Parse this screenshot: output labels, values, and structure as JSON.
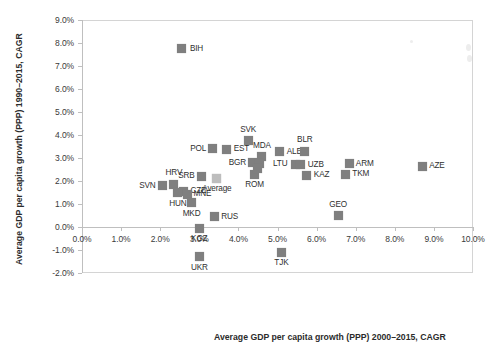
{
  "chart_data": {
    "type": "scatter",
    "title": "",
    "xlabel": "Average GDP per capita growth (PPP) 2000–2015, CAGR",
    "ylabel": "Average GDP per capita growth (PPP) 1990–2015, CAGR",
    "xlim": [
      0.0,
      10.0
    ],
    "ylim": [
      -2.0,
      9.0
    ],
    "xtick_labels": [
      "0.0%",
      "1.0%",
      "2.0%",
      "3.0%",
      "4.0%",
      "5.0%",
      "6.0%",
      "7.0%",
      "8.0%",
      "9.0%",
      "10.0%"
    ],
    "xticks": [
      0,
      1,
      2,
      3,
      4,
      5,
      6,
      7,
      8,
      9,
      10
    ],
    "ytick_labels": [
      "-2.0%",
      "-1.0%",
      "0.0%",
      "1.0%",
      "2.0%",
      "3.0%",
      "4.0%",
      "5.0%",
      "6.0%",
      "7.0%",
      "8.0%",
      "9.0%"
    ],
    "yticks": [
      -2,
      -1,
      0,
      1,
      2,
      3,
      4,
      5,
      6,
      7,
      8,
      9
    ],
    "grid": false,
    "legend": "none",
    "marker_color": "#7f7f7f",
    "average_marker_color": "#bdbdbd",
    "units": "percent",
    "points": [
      {
        "label": "BIH",
        "x": 2.55,
        "y": 7.75,
        "label_pos": "right"
      },
      {
        "label": "SVK",
        "x": 4.25,
        "y": 3.75,
        "label_pos": "above"
      },
      {
        "label": "POL",
        "x": 3.35,
        "y": 3.4,
        "label_pos": "left"
      },
      {
        "label": "EST",
        "x": 3.7,
        "y": 3.38,
        "label_pos": "right"
      },
      {
        "label": "ALB",
        "x": 5.05,
        "y": 3.28,
        "label_pos": "right"
      },
      {
        "label": "BLR",
        "x": 5.7,
        "y": 3.3,
        "label_pos": "above"
      },
      {
        "label": "ARM",
        "x": 6.85,
        "y": 2.75,
        "label_pos": "right"
      },
      {
        "label": "AZE",
        "x": 8.7,
        "y": 2.65,
        "label_pos": "right"
      },
      {
        "label": "MDA",
        "x": 4.6,
        "y": 3.05,
        "label_pos": "above"
      },
      {
        "label": "BGR",
        "x": 4.35,
        "y": 2.8,
        "label_pos": "left"
      },
      {
        "label": "SVK2",
        "x": 4.55,
        "y": 2.78,
        "label_pos": "none"
      },
      {
        "label": "LTU",
        "x": 5.45,
        "y": 2.72,
        "label_pos": "left"
      },
      {
        "label": "UZB",
        "x": 5.6,
        "y": 2.7,
        "label_pos": "right"
      },
      {
        "label": "KAZ",
        "x": 5.75,
        "y": 2.25,
        "label_pos": "right"
      },
      {
        "label": "TKM",
        "x": 6.75,
        "y": 2.3,
        "label_pos": "right"
      },
      {
        "label": "SRB",
        "x": 3.05,
        "y": 2.2,
        "label_pos": "left"
      },
      {
        "label": "Average",
        "x": 3.45,
        "y": 2.12,
        "label_pos": "below",
        "is_average": true
      },
      {
        "label": "ROM",
        "x": 4.4,
        "y": 2.3,
        "label_pos": "below"
      },
      {
        "label": "ROU2",
        "x": 4.5,
        "y": 2.55,
        "label_pos": "none"
      },
      {
        "label": "HRV",
        "x": 2.35,
        "y": 1.85,
        "label_pos": "above"
      },
      {
        "label": "SVN",
        "x": 2.05,
        "y": 1.8,
        "label_pos": "left"
      },
      {
        "label": "CZE",
        "x": 2.6,
        "y": 1.55,
        "label_pos": "right"
      },
      {
        "label": "HUN",
        "x": 2.45,
        "y": 1.48,
        "label_pos": "below"
      },
      {
        "label": "MNE",
        "x": 2.7,
        "y": 1.42,
        "label_pos": "right"
      },
      {
        "label": "MKD",
        "x": 2.8,
        "y": 1.05,
        "label_pos": "below"
      },
      {
        "label": "GEO",
        "x": 6.55,
        "y": 0.5,
        "label_pos": "above"
      },
      {
        "label": "RUS",
        "x": 3.4,
        "y": 0.45,
        "label_pos": "right"
      },
      {
        "label": "KGZ",
        "x": 3.0,
        "y": -0.05,
        "label_pos": "below"
      },
      {
        "label": "TJK",
        "x": 5.1,
        "y": -1.1,
        "label_pos": "below"
      },
      {
        "label": "UKR",
        "x": 3.0,
        "y": -1.3,
        "label_pos": "below"
      }
    ]
  }
}
